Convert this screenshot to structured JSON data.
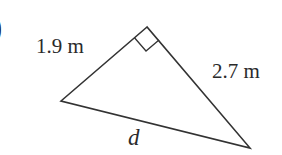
{
  "figure": {
    "type": "right-triangle",
    "part_marker": ")",
    "labels": {
      "leg_short": "1.9 m",
      "leg_long": "2.7 m",
      "hypotenuse": "d"
    },
    "right_angle_marker": true,
    "line_color": "#333333"
  }
}
